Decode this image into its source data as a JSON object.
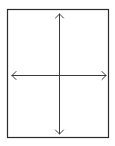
{
  "diagram": {
    "width": 115,
    "height": 146,
    "background": "#ffffff",
    "frame": {
      "x": 7.5,
      "y": 9.5,
      "width": 101,
      "height": 128,
      "stroke": "#2b2b2b",
      "stroke_width": 1.2
    },
    "axes": {
      "stroke": "#3a3a3a",
      "stroke_width": 1,
      "arrowhead_size": 4,
      "vertical": {
        "x": 59.5,
        "y1": 14,
        "y2": 134,
        "arrows": [
          "up",
          "down"
        ]
      },
      "horizontal": {
        "y": 75.5,
        "x1": 12,
        "x2": 106,
        "arrows": [
          "left",
          "right"
        ]
      }
    }
  }
}
